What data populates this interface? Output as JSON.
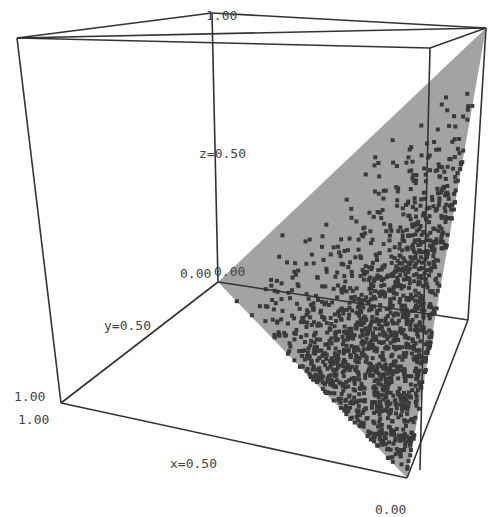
{
  "chart_data": {
    "type": "scatter3d",
    "title": "",
    "axes": {
      "x": {
        "label": "x=0.50",
        "range": [
          0,
          1
        ],
        "ticks": [
          "0.00",
          "x=0.50",
          "1.00"
        ]
      },
      "y": {
        "label": "y=0.50",
        "range": [
          0,
          1
        ],
        "ticks": [
          "0.00",
          "y=0.50",
          "1.00"
        ]
      },
      "z": {
        "label": "z=0.50",
        "range": [
          0,
          1
        ],
        "ticks": [
          "0.00",
          "z=0.50",
          "1.00"
        ]
      }
    },
    "surface": {
      "shape": "triangle",
      "color": "#9e9e9e"
    },
    "points": {
      "color": "#3a3a3a",
      "marker": "square",
      "approx_count": 1500,
      "density": "increasing toward the bottom-front vertex"
    },
    "grid": false,
    "legend": null
  },
  "labels": {
    "z_top": "1.00",
    "z_mid": "z=0.50",
    "origin_a": "0.00",
    "origin_b": "0.00",
    "y_mid": "y=0.50",
    "y_max": "1.00",
    "x_max": "1.00",
    "x_mid": "x=0.50",
    "x_min": "0.00"
  },
  "colors": {
    "frame": "#333333",
    "surface": "#9e9e9e",
    "points": "#3a3a3a",
    "text": "#444444"
  }
}
